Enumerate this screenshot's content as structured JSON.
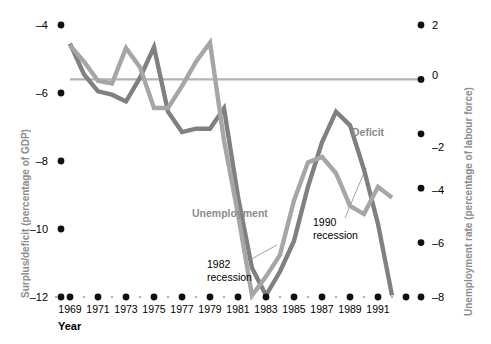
{
  "chart_data": {
    "type": "line",
    "title": "",
    "xlabel": "Year",
    "left_axis": {
      "label": "Surplus/deficit (percentage of GDP)",
      "ticks": [
        -4,
        -6,
        -8,
        -10,
        -12
      ],
      "tick_labels": [
        "–4",
        "–6",
        "–8",
        "–10",
        "–12"
      ],
      "range": [
        -12.8,
        -3.4
      ]
    },
    "right_axis": {
      "label": "Unemployment rate (percentage of labour force)",
      "ticks": [
        2,
        0,
        -2,
        -4,
        -6,
        -8
      ],
      "tick_labels": [
        "2",
        "0",
        "–2",
        "–4",
        "–6",
        "–8"
      ],
      "range": [
        -8.8,
        2.4
      ]
    },
    "x": [
      1969,
      1970,
      1971,
      1972,
      1973,
      1974,
      1975,
      1976,
      1977,
      1978,
      1979,
      1980,
      1981,
      1982,
      1983,
      1984,
      1985,
      1986,
      1987,
      1988,
      1989,
      1990,
      1991,
      1992
    ],
    "x_tick_labels": [
      "1969",
      "1971",
      "1973",
      "1975",
      "1977",
      "1979",
      "1981",
      "1983",
      "1985",
      "1987",
      "1989",
      "1991"
    ],
    "gridlines": [
      {
        "axis": "right",
        "value": 0,
        "color": "#b3b3b3"
      }
    ],
    "legend_position": "inline-annotations",
    "series": [
      {
        "name": "Deficit",
        "axis": "left",
        "color": "#808080",
        "unit": "percentage of GDP",
        "values": [
          -4.55,
          -5.45,
          -5.95,
          -6.05,
          -6.25,
          -5.55,
          -4.65,
          -6.55,
          -7.15,
          -7.05,
          -7.05,
          -6.45,
          -9.05,
          -11.15,
          -11.95,
          -11.25,
          -10.35,
          -8.75,
          -7.45,
          -6.55,
          -6.95,
          -8.25,
          -9.85,
          -11.95
        ]
      },
      {
        "name": "Unemployment",
        "axis": "right",
        "color": "#a6a6a6",
        "unit": "percentage of labour force",
        "values": [
          1.25,
          0.65,
          -0.05,
          -0.15,
          1.15,
          0.45,
          -1.05,
          -1.05,
          -0.25,
          0.65,
          1.35,
          -2.25,
          -4.95,
          -7.95,
          -7.25,
          -6.45,
          -4.45,
          -3.05,
          -2.85,
          -3.45,
          -4.65,
          -4.95,
          -3.95,
          -4.35
        ]
      }
    ],
    "annotations": [
      {
        "name": "deficit-series-label",
        "text": "Deficit",
        "x": 1988,
        "color": "#8c8c8c",
        "bold": true
      },
      {
        "name": "unemployment-series-label",
        "text": "Unemployment",
        "x": 1979,
        "color": "#8c8c8c",
        "bold": true
      },
      {
        "name": "recession-1982-label",
        "line1": "1982",
        "line2": "recession",
        "points_to": 1983
      },
      {
        "name": "recession-1990-label",
        "line1": "1990",
        "line2": "recession",
        "points_to": 1990
      }
    ]
  },
  "axis_numbers": {
    "left": [
      "–4",
      "–6",
      "–8",
      "–10",
      "–12"
    ],
    "right": [
      "2",
      "0",
      "–2",
      "–4",
      "–6",
      "–8"
    ]
  },
  "labels": {
    "left_axis_title": "Surplus/deficit (percentage of GDP)",
    "right_axis_title": "Unemployment rate (percentage of labour force)",
    "x_axis_title": "Year",
    "deficit": "Deficit",
    "unemployment": "Unemployment",
    "rec82_l1": "1982",
    "rec82_l2": "recession",
    "rec90_l1": "1990",
    "rec90_l2": "recession"
  },
  "xticks": [
    "1969",
    "1971",
    "1973",
    "1975",
    "1977",
    "1979",
    "1981",
    "1983",
    "1985",
    "1987",
    "1989",
    "1991"
  ],
  "colors": {
    "deficit": "#808080",
    "unemployment": "#a6a6a6",
    "gridline": "#b3b3b3",
    "axis_title": "#8c8c8c",
    "tick": "#000000"
  }
}
